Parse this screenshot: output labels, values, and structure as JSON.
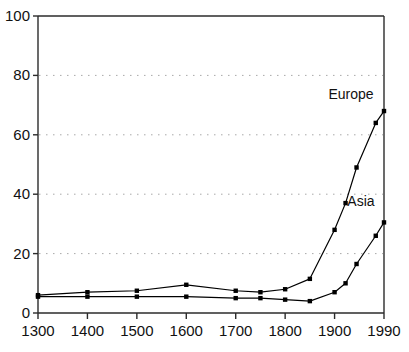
{
  "chart_data": {
    "type": "line",
    "title": "",
    "subtitle": "",
    "xlabel": "",
    "ylabel": "",
    "xlim": [
      1300,
      1990
    ],
    "ylim": [
      0,
      100
    ],
    "grid": "horizontal-dotted",
    "legend": "inline-annotations",
    "x": [
      1300,
      1400,
      1500,
      1600,
      1700,
      1750,
      1800,
      1850,
      1900,
      1920,
      1940,
      1975,
      1990
    ],
    "xticks": [
      "1300",
      "1400",
      "1500",
      "1600",
      "1700",
      "1800",
      "1900",
      "1990"
    ],
    "xtick_values": [
      1300,
      1400,
      1500,
      1600,
      1700,
      1800,
      1900,
      1990
    ],
    "yticks": [
      "0",
      "20",
      "40",
      "60",
      "80",
      "100"
    ],
    "ytick_values": [
      0,
      20,
      40,
      60,
      80,
      100
    ],
    "gridline_values": [
      20,
      40,
      60,
      80
    ],
    "series": [
      {
        "name": "Europe",
        "label": "Europe",
        "color": "#000000",
        "marker": "square",
        "values": [
          6.0,
          7.0,
          7.5,
          9.5,
          7.5,
          7.0,
          8.0,
          11.5,
          28.0,
          37.0,
          49.0,
          64.0,
          68.0
        ]
      },
      {
        "name": "Asia",
        "label": "Asia",
        "color": "#000000",
        "marker": "square",
        "values": [
          5.5,
          5.5,
          5.5,
          5.5,
          5.0,
          5.0,
          4.5,
          4.0,
          7.0,
          10.0,
          16.5,
          26.0,
          30.5
        ]
      }
    ],
    "annotations": [
      {
        "text": "Europe",
        "series": "Europe",
        "x": 1930,
        "y": 72
      },
      {
        "text": "Asia",
        "series": "Asia",
        "x": 1948,
        "y": 36
      }
    ]
  },
  "style": {
    "axis_color": "#2b2b2b",
    "line_color": "#1a1a1a",
    "grid_color": "#a8a8a8",
    "text_color": "#111111",
    "background": "#ffffff"
  }
}
